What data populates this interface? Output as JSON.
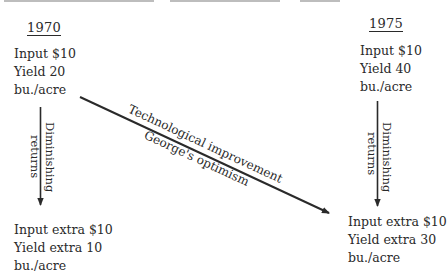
{
  "diagram": {
    "caption_cropped": true,
    "left_column": {
      "year": "1970",
      "top_block": {
        "line1": "Input $10",
        "line2": "Yield 20",
        "line3": "bu./acre"
      },
      "vertical_arrow_label": {
        "line1": "Diminishing",
        "line2": "returns"
      },
      "bottom_block": {
        "line1": "Input extra $10",
        "line2": "Yield extra 10",
        "line3": "bu./acre"
      }
    },
    "right_column": {
      "year": "1975",
      "top_block": {
        "line1": "Input $10",
        "line2": "Yield 40",
        "line3": "bu./acre"
      },
      "vertical_arrow_label": {
        "line1": "Diminishing",
        "line2": "returns"
      },
      "bottom_block": {
        "line1": "Input extra $10",
        "line2": "Yield extra 30",
        "line3": "bu./acre"
      }
    },
    "diagonal_arrow": {
      "label_above": "Technological improvement",
      "label_below": "George's optimism"
    },
    "colors": {
      "ink": "#2a2a2a",
      "background": "#ffffff"
    }
  }
}
